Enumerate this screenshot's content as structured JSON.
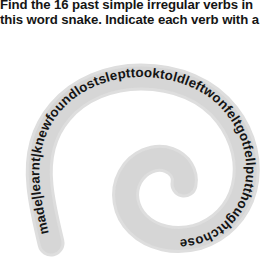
{
  "page": {
    "background_color": "#ffffff",
    "text_color": "#151515"
  },
  "instructions": {
    "line1": "Find the 16 past simple irregular verbs in",
    "line2": "this word snake. Indicate each verb with a"
  },
  "snake": {
    "label": "word-snake-spiral",
    "band_color": "#dedede",
    "text_color": "#141414",
    "letters": "made|learnt|knewfoundlostslepttooktoldleftwonfeltgotfellputthoughtchose",
    "verb_count": 16,
    "verbs": [
      "made",
      "learnt",
      "knew",
      "found",
      "lost",
      "slept",
      "took",
      "told",
      "left",
      "won",
      "felt",
      "got",
      "fell",
      "put",
      "thought",
      "chose"
    ],
    "separators_shown": 2
  }
}
